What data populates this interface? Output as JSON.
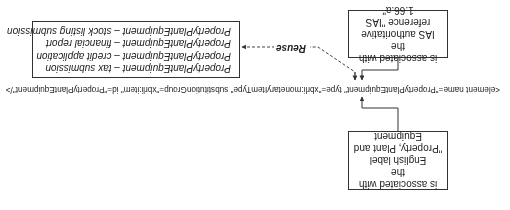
{
  "orientation": "rotated-180",
  "element_declaration": "<element name=\"PropertyPlantEquipment\" type=\"xbrli:monetaryItemType\" substitutionGroup=\"xbrli:item\" id=\"PropertyPlantEquipment\"/>",
  "label_box": {
    "lines": [
      "is associated with the",
      "English label",
      "\"Property, Plant and",
      "Equipment"
    ]
  },
  "reference_box": {
    "lines": [
      "is associated with the",
      "IAS authoritative",
      "reference \"IAS 1.66.a\""
    ]
  },
  "reuse": {
    "label": "Reuse",
    "uses": [
      "PropertyPlantEquipment – tax submission",
      "PropertyPlantEquipment – credit application",
      "PropertyPlantEquipment – financial report",
      "PropertyPlantEquipment – stock listing submission"
    ]
  },
  "colors": {
    "line": "#333333",
    "text": "#222222",
    "background": "#ffffff"
  }
}
